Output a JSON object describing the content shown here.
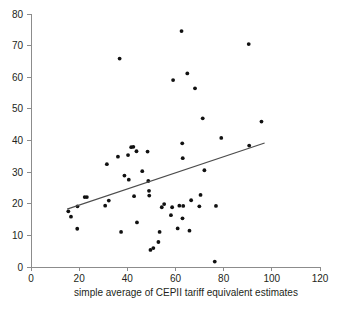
{
  "chart_data": {
    "type": "scatter",
    "title": "",
    "xlabel": "simple average of CEPII tariff equivalent estimates",
    "ylabel": "",
    "xlim": [
      0,
      120
    ],
    "ylim": [
      0,
      80
    ],
    "xticks": [
      0,
      20,
      40,
      60,
      80,
      100,
      120
    ],
    "yticks": [
      0,
      10,
      20,
      30,
      40,
      50,
      60,
      70,
      80
    ],
    "grid": false,
    "legend": "none",
    "marker_color": "#111111",
    "axis_color": "#8c8c8c",
    "trendline": {
      "label": "linear fit",
      "color": "#4d4d4d",
      "x_start": 15,
      "y_start": 18.3,
      "x_end": 97,
      "y_end": 39.2
    },
    "points": [
      {
        "x": 15.5,
        "y": 17.6
      },
      {
        "x": 16.6,
        "y": 15.9
      },
      {
        "x": 19.2,
        "y": 12.1
      },
      {
        "x": 19.3,
        "y": 19.2
      },
      {
        "x": 22.3,
        "y": 22.1
      },
      {
        "x": 23.2,
        "y": 22.1
      },
      {
        "x": 30.8,
        "y": 19.4
      },
      {
        "x": 31.5,
        "y": 32.5
      },
      {
        "x": 32.3,
        "y": 21.0
      },
      {
        "x": 36.1,
        "y": 34.9
      },
      {
        "x": 36.8,
        "y": 65.9
      },
      {
        "x": 37.4,
        "y": 11.1
      },
      {
        "x": 38.8,
        "y": 28.9
      },
      {
        "x": 40.3,
        "y": 35.4
      },
      {
        "x": 40.6,
        "y": 27.6
      },
      {
        "x": 41.6,
        "y": 37.9
      },
      {
        "x": 42.5,
        "y": 38.0
      },
      {
        "x": 42.8,
        "y": 22.4
      },
      {
        "x": 43.8,
        "y": 36.6
      },
      {
        "x": 44.0,
        "y": 14.1
      },
      {
        "x": 46.2,
        "y": 30.3
      },
      {
        "x": 48.4,
        "y": 36.5
      },
      {
        "x": 48.7,
        "y": 27.2
      },
      {
        "x": 49.0,
        "y": 24.1
      },
      {
        "x": 49.1,
        "y": 22.6
      },
      {
        "x": 49.6,
        "y": 5.4
      },
      {
        "x": 50.8,
        "y": 6.0
      },
      {
        "x": 52.9,
        "y": 7.9
      },
      {
        "x": 53.4,
        "y": 11.1
      },
      {
        "x": 54.3,
        "y": 18.9
      },
      {
        "x": 55.3,
        "y": 19.9
      },
      {
        "x": 58.1,
        "y": 16.4
      },
      {
        "x": 58.6,
        "y": 18.9
      },
      {
        "x": 59.0,
        "y": 59.1
      },
      {
        "x": 60.9,
        "y": 12.2
      },
      {
        "x": 61.6,
        "y": 19.4
      },
      {
        "x": 62.5,
        "y": 74.6
      },
      {
        "x": 62.8,
        "y": 39.1
      },
      {
        "x": 62.9,
        "y": 15.4
      },
      {
        "x": 63.0,
        "y": 34.4
      },
      {
        "x": 63.2,
        "y": 19.3
      },
      {
        "x": 64.9,
        "y": 61.2
      },
      {
        "x": 65.8,
        "y": 11.5
      },
      {
        "x": 66.5,
        "y": 21.1
      },
      {
        "x": 68.1,
        "y": 56.5
      },
      {
        "x": 69.9,
        "y": 19.2
      },
      {
        "x": 70.4,
        "y": 22.8
      },
      {
        "x": 71.3,
        "y": 47.0
      },
      {
        "x": 72.0,
        "y": 30.6
      },
      {
        "x": 76.3,
        "y": 1.7
      },
      {
        "x": 76.8,
        "y": 19.3
      },
      {
        "x": 79.0,
        "y": 40.8
      },
      {
        "x": 90.4,
        "y": 70.5
      },
      {
        "x": 90.6,
        "y": 38.4
      },
      {
        "x": 95.7,
        "y": 46.0
      }
    ]
  },
  "axis": {
    "x_title": "simple average of CEPII tariff equivalent estimates"
  }
}
